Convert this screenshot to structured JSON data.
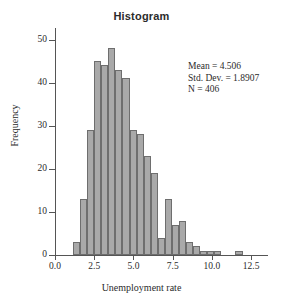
{
  "chart_data": {
    "type": "bar",
    "title": "Histogram",
    "xlabel": "Unemployment rate",
    "ylabel": "Frequency",
    "xlim": [
      0.0,
      13.0
    ],
    "ylim": [
      0,
      52
    ],
    "grid": false,
    "legend": null,
    "bin_width": 0.45,
    "xticks": [
      "0.0",
      "2.5",
      "5.0",
      "7.5",
      "10.0",
      "12.5"
    ],
    "xtick_values": [
      0.0,
      2.5,
      5.0,
      7.5,
      10.0,
      12.5
    ],
    "yticks": [
      "0",
      "10",
      "20",
      "30",
      "40",
      "50"
    ],
    "ytick_values": [
      0,
      10,
      20,
      30,
      40,
      50
    ],
    "bin_starts": [
      1.15,
      1.6,
      2.05,
      2.5,
      2.95,
      3.4,
      3.85,
      4.3,
      4.75,
      5.2,
      5.65,
      6.1,
      6.55,
      7.0,
      7.45,
      7.9,
      8.35,
      8.8,
      9.25,
      9.7,
      10.15,
      10.6,
      11.05,
      11.5,
      11.95
    ],
    "bin_centers": [
      1.38,
      1.83,
      2.28,
      2.73,
      3.18,
      3.63,
      4.08,
      4.53,
      4.98,
      5.43,
      5.88,
      6.33,
      6.78,
      7.23,
      7.68,
      8.13,
      8.58,
      9.03,
      9.48,
      9.93,
      10.38,
      10.83,
      11.28,
      11.73,
      12.18
    ],
    "values": [
      3,
      13,
      29,
      45,
      44,
      48,
      43,
      41,
      29,
      28,
      23,
      19,
      4,
      13,
      7,
      8,
      3,
      2,
      1,
      1,
      1,
      0,
      0,
      1,
      0
    ],
    "bar_color": "#a9a9a9",
    "bar_edge_color": "#6e6e6e",
    "annotations": {
      "mean_label": "Mean = 4.506",
      "stddev_label": "Std. Dev. = 1.8907",
      "n_label": "N = 406"
    },
    "statistics": {
      "mean": 4.506,
      "std_dev": 1.8907,
      "n": 406
    }
  }
}
